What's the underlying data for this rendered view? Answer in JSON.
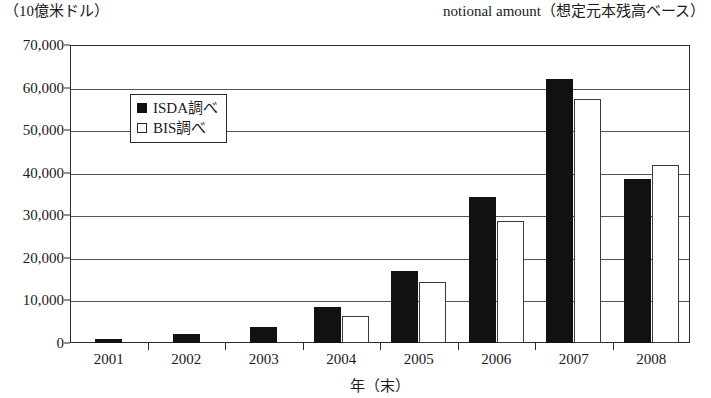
{
  "unit_label": "（10億米ドル）",
  "title": "notional amount（想定元本残高ベース）",
  "x_axis_title": "年（末）",
  "legend": {
    "items": [
      {
        "label": "ISDA調べ",
        "swatch": "filled-square-icon",
        "color": "#111111"
      },
      {
        "label": "BIS調べ",
        "swatch": "hollow-square-icon",
        "color": "#ffffff"
      }
    ]
  },
  "y_ticks": [
    "0",
    "10,000",
    "20,000",
    "30,000",
    "40,000",
    "50,000",
    "60,000",
    "70,000"
  ],
  "chart_data": {
    "type": "bar",
    "title": "notional amount（想定元本残高ベース）",
    "xlabel": "年（末）",
    "ylabel": "（10億米ドル）",
    "ylim": [
      0,
      70000
    ],
    "ytick_step": 10000,
    "grid": true,
    "legend_position": "inside-top-left",
    "categories": [
      "2001",
      "2002",
      "2003",
      "2004",
      "2005",
      "2006",
      "2007",
      "2008"
    ],
    "series": [
      {
        "name": "ISDA調べ",
        "style": "filled",
        "color": "#111111",
        "values": [
          900,
          2200,
          3800,
          8400,
          17000,
          34400,
          62000,
          38600
        ]
      },
      {
        "name": "BIS調べ",
        "style": "hollow",
        "color": "#ffffff",
        "values": [
          null,
          null,
          null,
          6400,
          14300,
          28600,
          57400,
          41900
        ]
      }
    ]
  }
}
